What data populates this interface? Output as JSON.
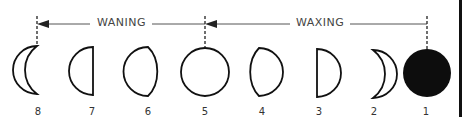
{
  "diagram": {
    "arrows": [
      {
        "label": "WANING",
        "from_x": 230,
        "to_x": 37
      },
      {
        "label": "WAXING",
        "from_x": 425,
        "to_x": 205
      }
    ],
    "phases": [
      {
        "number": "8",
        "shape": "waning-crescent",
        "cx": 25
      },
      {
        "number": "7",
        "shape": "last-quarter",
        "cx": 82
      },
      {
        "number": "6",
        "shape": "waning-gibbous",
        "cx": 143
      },
      {
        "number": "5",
        "shape": "full",
        "cx": 205
      },
      {
        "number": "4",
        "shape": "waxing-gibbous",
        "cx": 263
      },
      {
        "number": "3",
        "shape": "first-quarter",
        "cx": 320
      },
      {
        "number": "2",
        "shape": "waxing-crescent",
        "cx": 374
      },
      {
        "number": "1",
        "shape": "new",
        "cx": 427
      }
    ]
  }
}
